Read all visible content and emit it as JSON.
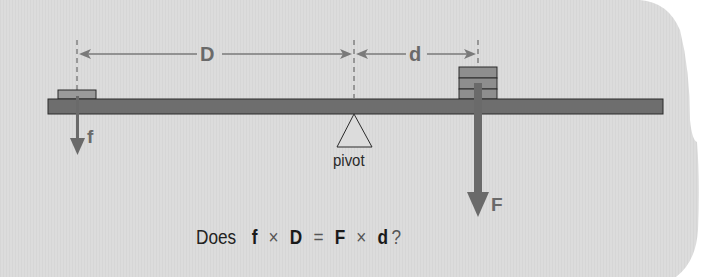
{
  "diagram": {
    "colors": {
      "background_panel": "#dcdcdc",
      "page": "#ffffff",
      "beam": "#6e6e6e",
      "weight": "#8f8f8f",
      "arrow": "#6a6a6a",
      "outline": "#2a2a2a"
    },
    "labels": {
      "long_distance": "D",
      "short_distance": "d",
      "small_force": "f",
      "large_force": "F",
      "pivot": "pivot"
    },
    "left_weight": {
      "blocks": 1
    },
    "right_weight": {
      "blocks": 3
    },
    "equation": {
      "prefix": "Does",
      "term1_var": "f",
      "op1": "×",
      "term2_var": "D",
      "equals": "=",
      "term3_var": "F",
      "op2": "×",
      "term4_var": "d",
      "suffix": "?"
    }
  }
}
